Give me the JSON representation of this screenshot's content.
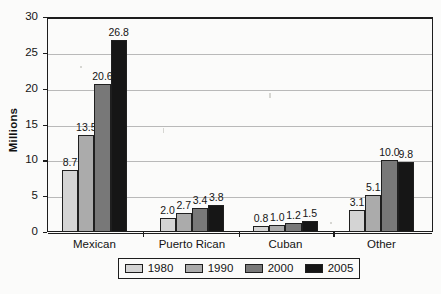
{
  "chart_data": {
    "type": "bar",
    "title": "",
    "xlabel": "",
    "ylabel": "Millions",
    "ylim": [
      0,
      30
    ],
    "ytick_values": [
      0,
      5,
      10,
      15,
      20,
      25,
      30
    ],
    "ytick_labels": [
      "0",
      "5",
      "10",
      "15",
      "20",
      "25",
      "30"
    ],
    "grid": true,
    "legend_position": "bottom",
    "categories": [
      "Mexican",
      "Puerto Rican",
      "Cuban",
      "Other"
    ],
    "series": [
      {
        "name": "1980",
        "color": "#d4d4d4",
        "values": [
          8.7,
          2.0,
          0.8,
          3.1
        ],
        "labels": [
          "8.7",
          "2.0",
          "0.8",
          "3.1"
        ]
      },
      {
        "name": "1990",
        "color": "#ababab",
        "values": [
          13.5,
          2.7,
          1.0,
          5.1
        ],
        "labels": [
          "13.5",
          "2.7",
          "1.0",
          "5.1"
        ]
      },
      {
        "name": "2000",
        "color": "#787878",
        "values": [
          20.6,
          3.4,
          1.2,
          10.0
        ],
        "labels": [
          "20.6",
          "3.4",
          "1.2",
          "10.0"
        ]
      },
      {
        "name": "2005",
        "color": "#161616",
        "values": [
          26.8,
          3.8,
          1.5,
          9.8
        ],
        "labels": [
          "26.8",
          "3.8",
          "1.5",
          "9.8"
        ]
      }
    ]
  },
  "legend": {
    "items": [
      {
        "label": "1980",
        "color": "#d4d4d4"
      },
      {
        "label": "1990",
        "color": "#ababab"
      },
      {
        "label": "2000",
        "color": "#787878"
      },
      {
        "label": "2005",
        "color": "#161616"
      }
    ]
  },
  "axis": {
    "y_title": "Millions"
  }
}
